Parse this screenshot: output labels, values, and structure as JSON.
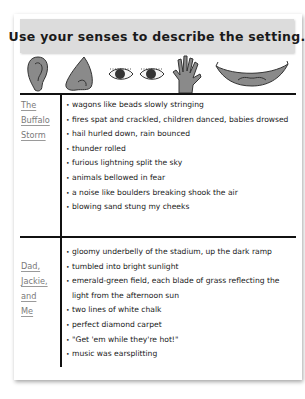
{
  "worksheet": {
    "title": "Use your senses to describe the setting.",
    "sense_icons": [
      "ear-icon",
      "nose-icon",
      "eyes-icon",
      "hand-icon",
      "mouth-icon"
    ],
    "sections": [
      {
        "label_lines": [
          "The",
          "Buffalo",
          "Storm"
        ],
        "items": [
          "wagons like beads slowly stringing",
          "fires spat and crackled, children danced, babies drowsed",
          "hail hurled down, rain bounced",
          "thunder rolled",
          "furious lightning split the sky",
          "animals bellowed in fear",
          "a noise like boulders breaking shook the air",
          "blowing sand stung my cheeks"
        ]
      },
      {
        "label_lines": [
          "Dad,",
          "Jackie,",
          "and",
          "Me"
        ],
        "items": [
          "gloomy underbelly of the stadium, up the dark ramp",
          "tumbled into bright sunlight",
          "emerald-green field, each blade of grass reflecting the light from the afternoon sun",
          "two lines of white chalk",
          "perfect diamond carpet",
          "\"Get 'em while they're hot!\"",
          "music was earsplitting"
        ]
      }
    ],
    "colors": {
      "title_band": "#dcdcdc",
      "icon_fill": "#8a8a8a",
      "label_text": "#7a7a7a",
      "rule": "#111111"
    }
  }
}
